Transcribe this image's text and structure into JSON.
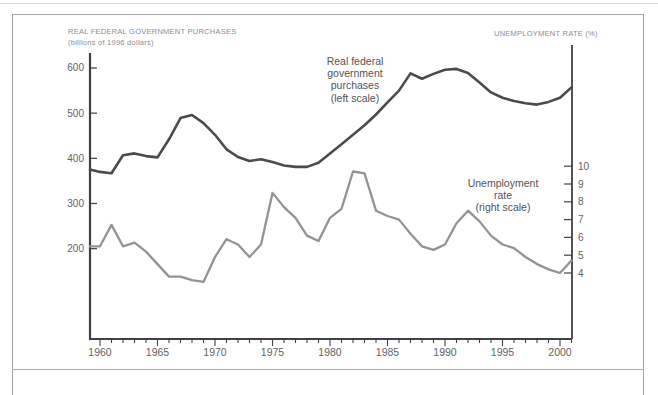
{
  "figure": {
    "left_axis_title_line1": "REAL FEDERAL GOVERNMENT PURCHASES",
    "left_axis_title_line2": "(billions of 1996 dollars)",
    "right_axis_title": "UNEMPLOYMENT RATE (%)"
  },
  "annotations": {
    "purchases_label": [
      "Real federal",
      "government",
      "purchases",
      "(left scale)"
    ],
    "unemployment_label": [
      "Unemployment",
      "rate",
      "(right scale)"
    ]
  },
  "chart_data": {
    "type": "line",
    "title": "",
    "x": [
      1959,
      1960,
      1961,
      1962,
      1963,
      1964,
      1965,
      1966,
      1967,
      1968,
      1969,
      1970,
      1971,
      1972,
      1973,
      1974,
      1975,
      1976,
      1977,
      1978,
      1979,
      1980,
      1981,
      1982,
      1983,
      1984,
      1985,
      1986,
      1987,
      1988,
      1989,
      1990,
      1991,
      1992,
      1993,
      1994,
      1995,
      1996,
      1997,
      1998,
      1999,
      2000,
      2001
    ],
    "series": [
      {
        "name": "Real federal government purchases (left scale)",
        "axis": "left",
        "color": "#4b4b4f",
        "stroke_width": 2.6,
        "values": [
          375,
          370,
          367,
          407,
          411,
          405,
          402,
          442,
          489,
          496,
          478,
          452,
          420,
          403,
          394,
          398,
          392,
          384,
          381,
          381,
          390,
          411,
          431,
          452,
          473,
          497,
          524,
          550,
          588,
          576,
          587,
          596,
          598,
          589,
          568,
          546,
          534,
          527,
          522,
          519,
          525,
          534,
          557
        ]
      },
      {
        "name": "Unemployment rate (right scale)",
        "axis": "right",
        "color": "#939397",
        "stroke_width": 2.3,
        "values": [
          5.5,
          5.5,
          6.7,
          5.5,
          5.7,
          5.2,
          4.5,
          3.8,
          3.8,
          3.6,
          3.5,
          4.9,
          5.9,
          5.6,
          4.9,
          5.6,
          8.5,
          7.7,
          7.1,
          6.1,
          5.8,
          7.1,
          7.6,
          9.7,
          9.6,
          7.5,
          7.2,
          7.0,
          6.2,
          5.5,
          5.3,
          5.6,
          6.8,
          7.5,
          6.9,
          6.1,
          5.6,
          5.4,
          4.9,
          4.5,
          4.2,
          4.0,
          4.7
        ]
      }
    ],
    "axes": {
      "left": {
        "title": "REAL FEDERAL GOVERNMENT PURCHASES (billions of 1996 dollars)",
        "ticks": [
          600,
          500,
          400,
          300,
          200
        ]
      },
      "right": {
        "title": "UNEMPLOYMENT RATE (%)",
        "ticks": [
          10,
          9,
          8,
          7,
          6,
          5,
          4
        ]
      },
      "x": {
        "major_ticks": [
          1960,
          1965,
          1970,
          1975,
          1980,
          1985,
          1990,
          1995,
          2000
        ],
        "minor_tick_interval_years": 1,
        "range": [
          1959,
          2001
        ]
      }
    },
    "grid": false,
    "legend": "inline-annotations",
    "colors": {
      "axis": "#414144",
      "tick_label": "#636366"
    }
  }
}
